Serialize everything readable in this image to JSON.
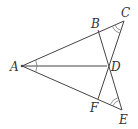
{
  "diagram": {
    "type": "geometry",
    "stroke_color": "#444444",
    "points": [
      {
        "name": "A",
        "x": 22,
        "y": 66,
        "label_x": 10,
        "label_y": 71
      },
      {
        "name": "B",
        "x": 98,
        "y": 30,
        "label_x": 91,
        "label_y": 28
      },
      {
        "name": "C",
        "x": 124,
        "y": 21,
        "label_x": 121,
        "label_y": 17
      },
      {
        "name": "D",
        "x": 107,
        "y": 66,
        "label_x": 111,
        "label_y": 71
      },
      {
        "name": "F",
        "x": 98,
        "y": 99,
        "label_x": 90,
        "label_y": 112
      },
      {
        "name": "E",
        "x": 122,
        "y": 110,
        "label_x": 119,
        "label_y": 124
      }
    ],
    "segments": [
      [
        "A",
        "C"
      ],
      [
        "A",
        "E"
      ],
      [
        "A",
        "D"
      ],
      [
        "B",
        "E"
      ],
      [
        "F",
        "C"
      ]
    ],
    "angle_marks": [
      {
        "vertex": "A",
        "arcs": 1
      },
      {
        "vertex": "C",
        "arcs": 2
      },
      {
        "vertex": "E",
        "arcs": 2
      }
    ],
    "labels": {
      "A": "A",
      "B": "B",
      "C": "C",
      "D": "D",
      "E": "E",
      "F": "F"
    }
  }
}
